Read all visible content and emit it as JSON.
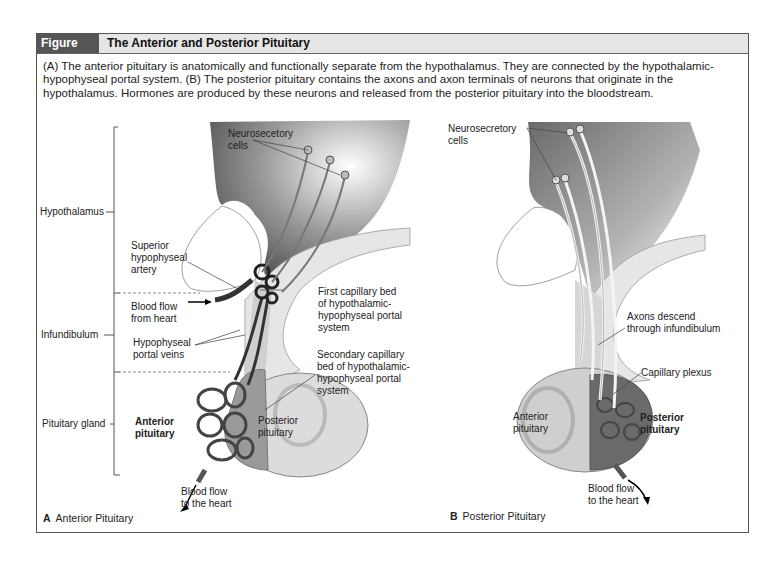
{
  "figure": {
    "number": "Figure 17.12",
    "title": "The Anterior and Posterior Pituitary",
    "caption": "(A) The anterior pituitary is anatomically and functionally separate from the hypothalamus. They are connected by the hypothalamic-hypophyseal portal system. (B) The posterior pituitary contains the axons and axon terminals of neurons that originate in the hypothalamus. Hormones are produced by these neurons and released from the posterior pituitary into the bloodstream.",
    "colors": {
      "header_bg": "#555555",
      "header_strip": "#e6e6e6",
      "tissue_gray": "#9a9a9a",
      "vessel_dark": "#3a3a3a"
    }
  },
  "panel_a": {
    "letter": "A",
    "name": "Anterior Pituitary",
    "region_labels": {
      "hypothalamus": "Hypothalamus",
      "infundibulum": "Infundibulum",
      "pituitary_gland": "Pituitary gland"
    },
    "labels": {
      "neurosecretory_1": "Neurosecetory",
      "neurosecretory_2": "cells",
      "sup_artery_1": "Superior",
      "sup_artery_2": "hypophyseal",
      "sup_artery_3": "artery",
      "blood_in_1": "Blood flow",
      "blood_in_2": "from heart",
      "portal_veins_1": "Hypophyseal",
      "portal_veins_2": "portal veins",
      "first_bed_1": "First capillary bed",
      "first_bed_2": "of hypothalamic-",
      "first_bed_3": "hypophyseal portal",
      "first_bed_4": "system",
      "second_bed_1": "Secondary capillary",
      "second_bed_2": "bed of hypothalamic-",
      "second_bed_3": "hypophyseal portal",
      "second_bed_4": "system",
      "anterior_1": "Anterior",
      "anterior_2": "pituitary",
      "posterior_1": "Posterior",
      "posterior_2": "pituitary",
      "blood_out_1": "Blood flow",
      "blood_out_2": "to the heart"
    }
  },
  "panel_b": {
    "letter": "B",
    "name": "Posterior Pituitary",
    "labels": {
      "neurosecretory_1": "Neurosecretory",
      "neurosecretory_2": "cells",
      "axons_1": "Axons descend",
      "axons_2": "through infundibulum",
      "plexus": "Capillary plexus",
      "anterior_1": "Anterior",
      "anterior_2": "pituitary",
      "posterior_1": "Posterior",
      "posterior_2": "pituitary",
      "blood_out_1": "Blood flow",
      "blood_out_2": "to the heart"
    }
  }
}
